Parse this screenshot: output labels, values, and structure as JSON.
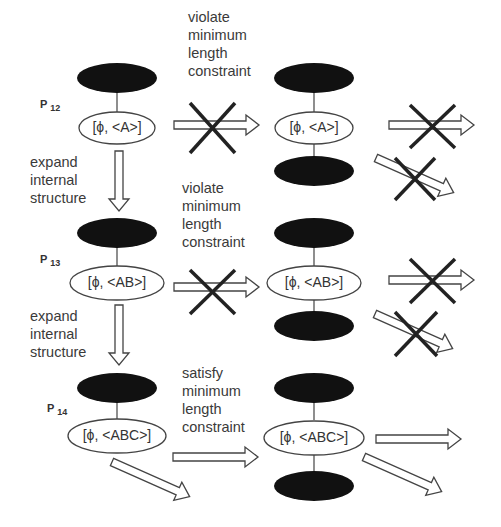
{
  "rows": [
    {
      "id": "P12",
      "pattern_label": "P",
      "pattern_sub": "12",
      "node_text": "[ϕ, <A>]",
      "transition_text": "violate\nminimum\nlength\nconstraint",
      "transition_result": "violate",
      "expand_text": "expand\ninternal\nstructure"
    },
    {
      "id": "P13",
      "pattern_label": "P",
      "pattern_sub": "13",
      "node_text": "[ϕ, <AB>]",
      "transition_text": "violate\nminimum\nlength\nconstraint",
      "transition_result": "violate",
      "expand_text": "expand\ninternal\nstructure"
    },
    {
      "id": "P14",
      "pattern_label": "P",
      "pattern_sub": "14",
      "node_text": "[ϕ, <ABC>]",
      "transition_text": "satisfy\nminimum\nlength\nconstraint",
      "transition_result": "satisfy"
    }
  ],
  "colors": {
    "filled_node": "#111111",
    "stroke": "#444444",
    "cross": "#222222"
  }
}
